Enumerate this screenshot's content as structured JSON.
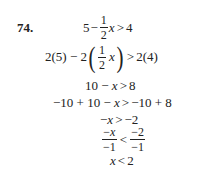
{
  "problem": {
    "number": "74.",
    "steps": [
      {
        "id": "step1",
        "text": "5 − (1/2)x > 4",
        "a": "5",
        "minus": "−",
        "frac_num": "1",
        "frac_den": "2",
        "var": "x",
        "rel": ">",
        "rhs": "4"
      },
      {
        "id": "step2",
        "text": "2(5) − 2((1/2)x) > 2(4)",
        "pre": "2(5) − 2",
        "lparen": "(",
        "frac_num": "1",
        "frac_den": "2",
        "var": "x",
        "rparen": ")",
        "rel": ">",
        "rhs": "2(4)"
      },
      {
        "id": "step3",
        "text": "10 − x > 8",
        "lhs": "10 − ",
        "var": "x",
        "rel": ">",
        "rhs": "8"
      },
      {
        "id": "step4",
        "text": "−10 + 10 − x > −10 + 8",
        "lhs": "−10 + 10 − ",
        "var": "x",
        "rel": ">",
        "rhs": "−10 + 8"
      },
      {
        "id": "step5",
        "text": "−x > −2",
        "lhs": "−",
        "var": "x",
        "rel": ">",
        "rhs": "−2"
      },
      {
        "id": "step6",
        "text": "−x/−1 < −2/−1",
        "l_num_sign": "−",
        "l_num_var": "x",
        "l_den": "−1",
        "rel": "<",
        "r_num": "−2",
        "r_den": "−1"
      },
      {
        "id": "step7",
        "text": "x < 2",
        "var": "x",
        "rel": "<",
        "rhs": "2"
      }
    ]
  }
}
